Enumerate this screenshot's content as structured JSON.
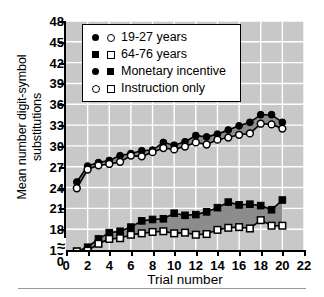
{
  "figure": {
    "background": "#ffffff",
    "plot_background": "#c8c8c8",
    "gridline_color": "#ffffff",
    "fill_color": "#8c8c8c",
    "line_color": "#000000",
    "axis_break_glyph": "≈"
  },
  "legend": {
    "position": "upper-left-inside",
    "entries": [
      {
        "label": "19-27 years",
        "markers": [
          "circle-filled",
          "circle-open"
        ]
      },
      {
        "label": "64-76 years",
        "markers": [
          "square-filled",
          "square-open"
        ]
      },
      {
        "label": "Monetary incentive",
        "markers": [
          "circle-filled",
          "square-filled"
        ]
      },
      {
        "label": "Instruction only",
        "markers": [
          "circle-open",
          "square-open"
        ]
      }
    ]
  },
  "chart_data": {
    "type": "line",
    "title": "",
    "xlabel": "Trial number",
    "ylabel": "Mean number digit-symbol substitutions",
    "xlim": [
      0,
      22
    ],
    "ylim": [
      15,
      48
    ],
    "xticks": [
      0,
      2,
      4,
      6,
      8,
      10,
      12,
      14,
      16,
      18,
      20,
      22
    ],
    "yticks": [
      15,
      18,
      21,
      24,
      27,
      30,
      33,
      36,
      39,
      42,
      45,
      48
    ],
    "y_axis_break": true,
    "y_axis_break_label": "0",
    "grid": true,
    "x": [
      1,
      2,
      3,
      4,
      5,
      6,
      7,
      8,
      9,
      10,
      11,
      12,
      13,
      14,
      15,
      16,
      17,
      18,
      19,
      20
    ],
    "series": [
      {
        "name": "19-27 years, Monetary incentive",
        "marker": "circle-filled",
        "values": [
          24.8,
          27.1,
          27.6,
          27.9,
          28.6,
          28.9,
          29.3,
          29.4,
          30.5,
          30.1,
          30.6,
          31.5,
          31.3,
          31.7,
          32.3,
          32.9,
          33.4,
          34.5,
          34.5,
          33.4
        ]
      },
      {
        "name": "19-27 years, Instruction only",
        "marker": "circle-open",
        "values": [
          23.9,
          26.6,
          27.2,
          27.4,
          27.7,
          28.6,
          28.5,
          29.1,
          29.7,
          29.5,
          29.9,
          30.5,
          30.2,
          30.9,
          31.2,
          31.6,
          31.8,
          33.2,
          33.1,
          32.5
        ]
      },
      {
        "name": "64-76 years, Monetary incentive",
        "marker": "square-filled",
        "values": [
          14.8,
          15.4,
          16.6,
          17.5,
          17.7,
          18.3,
          19.2,
          19.4,
          19.5,
          20.3,
          20.0,
          20.1,
          20.5,
          21.1,
          21.9,
          21.5,
          21.6,
          21.4,
          20.8,
          22.2
        ]
      },
      {
        "name": "64-76 years, Instruction only",
        "marker": "square-open",
        "values": [
          14.8,
          14.9,
          15.9,
          16.6,
          16.7,
          17.2,
          17.4,
          17.6,
          17.7,
          17.4,
          17.5,
          17.2,
          17.3,
          17.9,
          18.2,
          18.3,
          18.1,
          19.3,
          18.5,
          18.5
        ]
      }
    ]
  }
}
